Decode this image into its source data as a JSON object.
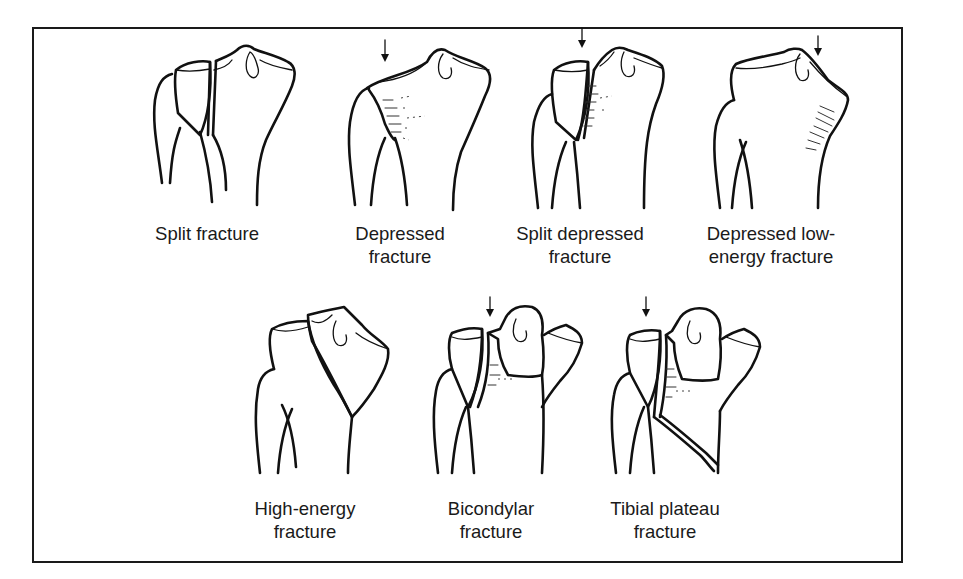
{
  "figure": {
    "panels": [
      {
        "id": "split",
        "label_lines": [
          "Split fracture"
        ],
        "has_arrow": false,
        "x": 150,
        "y": 40,
        "label_x": 207,
        "label_y": 222
      },
      {
        "id": "depressed",
        "label_lines": [
          "Depressed",
          "fracture"
        ],
        "has_arrow": true,
        "x": 345,
        "y": 40,
        "label_x": 400,
        "label_y": 222
      },
      {
        "id": "split-depressed",
        "label_lines": [
          "Split depressed",
          "fracture"
        ],
        "has_arrow": true,
        "x": 530,
        "y": 40,
        "label_x": 580,
        "label_y": 222
      },
      {
        "id": "depressed-low-energy",
        "label_lines": [
          "Depressed low-",
          "energy fracture"
        ],
        "has_arrow": true,
        "x": 710,
        "y": 40,
        "label_x": 771,
        "label_y": 222
      },
      {
        "id": "high-energy",
        "label_lines": [
          "High-energy",
          "fracture"
        ],
        "has_arrow": false,
        "x": 252,
        "y": 305,
        "label_x": 305,
        "label_y": 497
      },
      {
        "id": "bicondylar",
        "label_lines": [
          "Bicondylar",
          "fracture"
        ],
        "has_arrow": true,
        "x": 432,
        "y": 295,
        "label_x": 491,
        "label_y": 497
      },
      {
        "id": "tibial-plateau",
        "label_lines": [
          "Tibial plateau",
          "fracture"
        ],
        "has_arrow": true,
        "x": 610,
        "y": 295,
        "label_x": 665,
        "label_y": 497
      }
    ]
  },
  "colors": {
    "ink": "#111111",
    "frame": "#1a1a1a",
    "background": "#ffffff"
  }
}
